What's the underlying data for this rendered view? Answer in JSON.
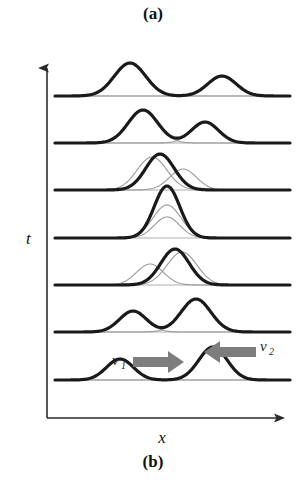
{
  "figure": {
    "panel_a_label": "(a)",
    "panel_b_label": "(b)",
    "axes": {
      "y_label": "t",
      "x_label": "x",
      "y_direction": "up",
      "x_direction": "right"
    },
    "annotations": {
      "v1_symbol": "v",
      "v1_subscript": "1",
      "v2_symbol": "v",
      "v2_subscript": "2"
    },
    "colors": {
      "wave_stroke": "#1a1a1a",
      "component_stroke": "#9a9a9a",
      "baseline": "#1a1a1a",
      "axis": "#2a2a2a",
      "arrow_fill": "#7d7d7d",
      "background": "#ffffff"
    }
  },
  "chart_data": {
    "type": "line",
    "title": "",
    "subtitle": "",
    "xlabel": "x",
    "ylabel": "t",
    "grid": false,
    "legend": "none",
    "xlim": [
      55,
      290
    ],
    "baseline_y_positions": [
      96,
      143,
      190,
      238,
      285,
      332,
      380
    ],
    "snapshots": [
      {
        "index": 7,
        "baseline_y": 96,
        "label": "pulses separated after passing through",
        "pulses": [
          {
            "name": "pulse-1",
            "center": 130,
            "amplitude": 33,
            "width": 22,
            "style": "bold"
          },
          {
            "name": "pulse-2",
            "center": 222,
            "amplitude": 20,
            "width": 20,
            "style": "bold"
          }
        ],
        "components": [
          {
            "name": "component-1",
            "center": 130,
            "amplitude": 33,
            "width": 22
          },
          {
            "name": "component-2",
            "center": 222,
            "amplitude": 20,
            "width": 20
          }
        ]
      },
      {
        "index": 6,
        "baseline_y": 143,
        "label": "pulses moving apart",
        "pulses": [
          {
            "name": "pulse-1",
            "center": 143,
            "amplitude": 33,
            "width": 21,
            "style": "bold"
          },
          {
            "name": "pulse-2",
            "center": 205,
            "amplitude": 21,
            "width": 19,
            "style": "bold"
          }
        ],
        "components": [
          {
            "name": "component-1",
            "center": 143,
            "amplitude": 33,
            "width": 21
          },
          {
            "name": "component-2",
            "center": 205,
            "amplitude": 21,
            "width": 19
          }
        ]
      },
      {
        "index": 5,
        "baseline_y": 190,
        "label": "partial overlap, separating",
        "pulses": [
          {
            "name": "resultant",
            "center": 160,
            "amplitude": 36,
            "width": 20,
            "style": "bold"
          }
        ],
        "components": [
          {
            "name": "component-1",
            "center": 152,
            "amplitude": 33,
            "width": 21
          },
          {
            "name": "component-2",
            "center": 183,
            "amplitude": 21,
            "width": 19
          }
        ]
      },
      {
        "index": 4,
        "baseline_y": 238,
        "label": "maximum constructive interference",
        "pulses": [
          {
            "name": "resultant",
            "center": 167,
            "amplitude": 52,
            "width": 18,
            "style": "bold"
          }
        ],
        "components": [
          {
            "name": "component-1",
            "center": 167,
            "amplitude": 33,
            "width": 20
          },
          {
            "name": "component-2",
            "center": 167,
            "amplitude": 21,
            "width": 18
          }
        ]
      },
      {
        "index": 3,
        "baseline_y": 285,
        "label": "partial overlap, approaching",
        "pulses": [
          {
            "name": "resultant",
            "center": 175,
            "amplitude": 36,
            "width": 20,
            "style": "bold"
          }
        ],
        "components": [
          {
            "name": "component-1",
            "center": 150,
            "amplitude": 21,
            "width": 19
          },
          {
            "name": "component-2",
            "center": 182,
            "amplitude": 33,
            "width": 21
          }
        ]
      },
      {
        "index": 2,
        "baseline_y": 332,
        "label": "pulses approaching",
        "pulses": [
          {
            "name": "pulse-1",
            "center": 133,
            "amplitude": 21,
            "width": 19,
            "style": "bold"
          },
          {
            "name": "pulse-2",
            "center": 196,
            "amplitude": 33,
            "width": 21,
            "style": "bold"
          }
        ],
        "components": [
          {
            "name": "component-1",
            "center": 133,
            "amplitude": 21,
            "width": 19
          },
          {
            "name": "component-2",
            "center": 196,
            "amplitude": 33,
            "width": 21
          }
        ]
      },
      {
        "index": 1,
        "baseline_y": 380,
        "label": "initial state, pulses far apart with velocity arrows",
        "pulses": [
          {
            "name": "pulse-1",
            "center": 120,
            "amplitude": 21,
            "width": 19,
            "style": "bold"
          },
          {
            "name": "pulse-2",
            "center": 213,
            "amplitude": 33,
            "width": 20,
            "style": "bold"
          }
        ],
        "components": [
          {
            "name": "component-1",
            "center": 120,
            "amplitude": 21,
            "width": 19
          },
          {
            "name": "component-2",
            "center": 213,
            "amplitude": 33,
            "width": 20
          }
        ]
      }
    ],
    "velocity_arrows": [
      {
        "name": "v1-arrow",
        "direction": "right",
        "x_start": 133,
        "x_end": 182,
        "y": 362,
        "label": "v1"
      },
      {
        "name": "v2-arrow",
        "direction": "left",
        "x_start": 256,
        "x_end": 204,
        "y": 352,
        "label": "v2"
      }
    ]
  }
}
